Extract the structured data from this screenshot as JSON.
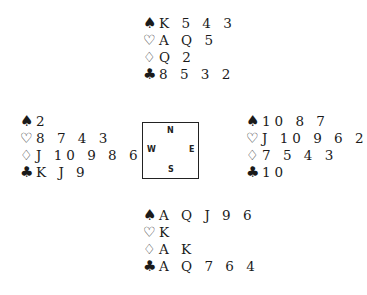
{
  "suit_symbols": {
    "spades": "♠",
    "hearts": "♡",
    "diamonds": "♢",
    "clubs": "♣"
  },
  "compass": {
    "north": "N",
    "south": "S",
    "west": "W",
    "east": "E"
  },
  "hands": {
    "north": {
      "spades": "K 5 4 3",
      "hearts": "A Q 5",
      "diamonds": "Q 2",
      "clubs": "8 5 3 2"
    },
    "west": {
      "spades": "2",
      "hearts": "8 7 4 3",
      "diamonds": "J 10 9 8 6",
      "clubs": "K J 9"
    },
    "east": {
      "spades": "10 8 7",
      "hearts": "J 10 9 6 2",
      "diamonds": "7 5 4 3",
      "clubs": "10"
    },
    "south": {
      "spades": "A Q J 9 6",
      "hearts": "K",
      "diamonds": "A K",
      "clubs": "A Q 7 6 4"
    }
  }
}
